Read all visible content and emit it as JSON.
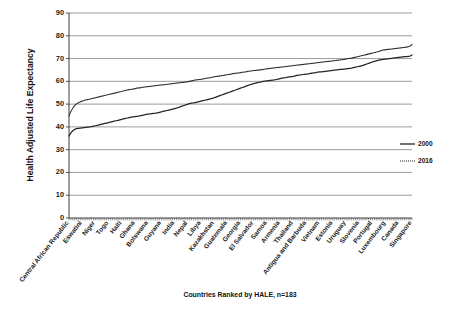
{
  "chart_data": {
    "type": "line",
    "title": "",
    "xlabel": "Countries Ranked by HALE, n=183",
    "ylabel": "Health Adjusted Life Expectancy",
    "ylim": [
      0,
      90
    ],
    "ytick_step": 10,
    "yticks": [
      0,
      10,
      20,
      30,
      40,
      50,
      60,
      70,
      80,
      90
    ],
    "grid": true,
    "legend_position": "right",
    "n_countries": 183,
    "x_tick_labels": [
      "Central African Republic",
      "Eswatini",
      "Niger",
      "Togo",
      "Haiti",
      "Ghana",
      "Botswana",
      "Guyana",
      "India",
      "Nepal",
      "Libya",
      "Kazakhstan",
      "Guatemala",
      "Georgia",
      "El Salvador",
      "Samoa",
      "Armenia",
      "Thailand",
      "Antigua and Barbuda",
      "Vietnam",
      "Estonia",
      "Uruguay",
      "Slovenia",
      "Portugal",
      "Luxembourg",
      "Canada",
      "Singapore"
    ],
    "series": [
      {
        "name": "2000",
        "color": "#242424",
        "style": "solid",
        "values": [
          36.0,
          37.4,
          38.3,
          38.9,
          39.2,
          39.4,
          39.5,
          39.6,
          39.7,
          39.8,
          39.9,
          40.0,
          40.1,
          40.3,
          40.5,
          40.7,
          40.9,
          41.1,
          41.3,
          41.5,
          41.7,
          41.9,
          42.1,
          42.3,
          42.5,
          42.7,
          42.9,
          43.1,
          43.3,
          43.5,
          43.7,
          43.9,
          44.1,
          44.3,
          44.4,
          44.5,
          44.6,
          44.7,
          44.9,
          45.1,
          45.3,
          45.5,
          45.6,
          45.7,
          45.8,
          45.9,
          46.0,
          46.2,
          46.4,
          46.6,
          46.8,
          47.0,
          47.2,
          47.4,
          47.6,
          47.8,
          48.0,
          48.2,
          48.5,
          48.8,
          49.1,
          49.4,
          49.7,
          50.0,
          50.2,
          50.4,
          50.5,
          50.7,
          50.9,
          51.1,
          51.3,
          51.5,
          51.7,
          51.9,
          52.1,
          52.3,
          52.5,
          52.8,
          53.1,
          53.4,
          53.7,
          54.0,
          54.3,
          54.6,
          54.9,
          55.2,
          55.5,
          55.8,
          56.1,
          56.4,
          56.7,
          57.0,
          57.3,
          57.6,
          57.9,
          58.2,
          58.5,
          58.8,
          59.0,
          59.2,
          59.4,
          59.6,
          59.8,
          60.0,
          60.1,
          60.2,
          60.3,
          60.4,
          60.5,
          60.6,
          60.8,
          61.0,
          61.2,
          61.4,
          61.5,
          61.6,
          61.8,
          62.0,
          62.1,
          62.2,
          62.4,
          62.6,
          62.7,
          62.8,
          63.0,
          63.1,
          63.2,
          63.3,
          63.5,
          63.6,
          63.7,
          63.8,
          64.0,
          64.1,
          64.2,
          64.3,
          64.4,
          64.5,
          64.6,
          64.7,
          64.8,
          64.9,
          65.0,
          65.1,
          65.2,
          65.3,
          65.4,
          65.5,
          65.6,
          65.7,
          65.8,
          66.0,
          66.2,
          66.4,
          66.6,
          66.8,
          67.0,
          67.3,
          67.6,
          67.9,
          68.2,
          68.5,
          68.8,
          69.0,
          69.2,
          69.4,
          69.5,
          69.6,
          69.8,
          69.9,
          70.0,
          70.1,
          70.2,
          70.3,
          70.4,
          70.5,
          70.6,
          70.7,
          70.8,
          70.9,
          71.0,
          71.1,
          71.6
        ]
      },
      {
        "name": "2016",
        "color": "#2e2e2e",
        "style": "dotted",
        "values": [
          44.8,
          46.8,
          48.3,
          49.4,
          50.1,
          50.6,
          51.0,
          51.3,
          51.6,
          51.9,
          52.0,
          52.2,
          52.4,
          52.6,
          52.8,
          53.0,
          53.2,
          53.4,
          53.6,
          53.8,
          54.0,
          54.2,
          54.4,
          54.6,
          54.8,
          55.0,
          55.2,
          55.4,
          55.6,
          55.8,
          56.0,
          56.2,
          56.4,
          56.5,
          56.6,
          56.8,
          57.0,
          57.1,
          57.2,
          57.4,
          57.5,
          57.6,
          57.7,
          57.8,
          57.9,
          58.0,
          58.1,
          58.2,
          58.3,
          58.4,
          58.5,
          58.6,
          58.7,
          58.8,
          58.9,
          59.0,
          59.1,
          59.2,
          59.3,
          59.4,
          59.5,
          59.6,
          59.7,
          59.8,
          60.0,
          60.2,
          60.4,
          60.6,
          60.7,
          60.8,
          60.9,
          61.0,
          61.2,
          61.4,
          61.5,
          61.6,
          61.8,
          62.0,
          62.1,
          62.2,
          62.4,
          62.5,
          62.6,
          62.8,
          62.9,
          63.0,
          63.2,
          63.4,
          63.5,
          63.6,
          63.7,
          63.8,
          64.0,
          64.1,
          64.2,
          64.4,
          64.5,
          64.6,
          64.7,
          64.8,
          64.9,
          65.0,
          65.1,
          65.2,
          65.4,
          65.5,
          65.6,
          65.7,
          65.8,
          65.9,
          66.0,
          66.1,
          66.2,
          66.3,
          66.4,
          66.5,
          66.6,
          66.7,
          66.8,
          66.9,
          67.0,
          67.1,
          67.2,
          67.3,
          67.4,
          67.5,
          67.6,
          67.7,
          67.8,
          67.9,
          68.0,
          68.1,
          68.2,
          68.3,
          68.4,
          68.5,
          68.6,
          68.7,
          68.8,
          68.9,
          69.0,
          69.1,
          69.2,
          69.3,
          69.4,
          69.5,
          69.6,
          69.8,
          70.0,
          70.1,
          70.2,
          70.4,
          70.6,
          70.8,
          71.0,
          71.2,
          71.4,
          71.6,
          71.8,
          72.0,
          72.2,
          72.4,
          72.6,
          72.8,
          73.0,
          73.3,
          73.6,
          73.8,
          73.9,
          74.0,
          74.1,
          74.2,
          74.3,
          74.4,
          74.5,
          74.6,
          74.7,
          74.8,
          74.9,
          75.0,
          75.2,
          75.5,
          76.2
        ]
      }
    ]
  },
  "legend": {
    "entries": [
      {
        "label": "2000"
      },
      {
        "label": "2016"
      }
    ]
  }
}
